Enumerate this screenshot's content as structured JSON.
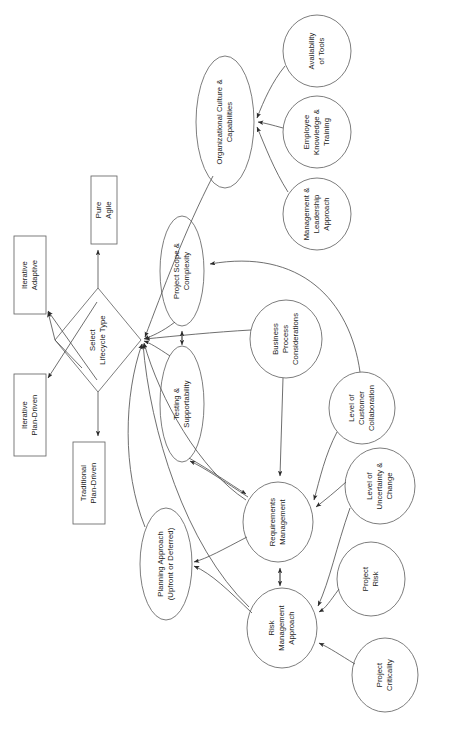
{
  "diagram": {
    "style": {
      "stroke": "#4d4d4d",
      "node_fill": "#ffffff",
      "text_color": "#1a1a1a",
      "background": "#ffffff",
      "text_orientation": "rotated-90-ccw"
    },
    "nodes": [
      {
        "id": "pure_agile",
        "label": "Pure\nAgile",
        "shape": "rectangle",
        "x": 91,
        "y": 176,
        "w": 26,
        "h": 68
      },
      {
        "id": "iter_adaptive",
        "label": "Iterative\nAdaptive",
        "shape": "rectangle",
        "x": 14,
        "y": 236,
        "w": 32,
        "h": 78
      },
      {
        "id": "iter_plan",
        "label": "Iterative\nPlan-Driven",
        "shape": "rectangle",
        "x": 14,
        "y": 374,
        "w": 32,
        "h": 82
      },
      {
        "id": "trad_plan",
        "label": "Traditional\nPlan-Driven",
        "shape": "rectangle",
        "x": 73,
        "y": 442,
        "w": 32,
        "h": 82
      },
      {
        "id": "select",
        "label": "Select\nLifecycle Type",
        "shape": "diamond",
        "x": 55,
        "y": 288,
        "w": 86,
        "h": 104
      },
      {
        "id": "org_culture",
        "label": "Organizational Culture &\nCapabilities",
        "shape": "ellipse",
        "x": 196,
        "y": 56,
        "w": 58,
        "h": 132
      },
      {
        "id": "avail_tools",
        "label": "Availability\nof Tools",
        "shape": "ellipse",
        "x": 283,
        "y": 15,
        "w": 68,
        "h": 72
      },
      {
        "id": "emp_knowledge",
        "label": "Employee\nKnowledge &\nTraining",
        "shape": "ellipse",
        "x": 283,
        "y": 96,
        "w": 68,
        "h": 72
      },
      {
        "id": "mgmt_leadership",
        "label": "Management &\nLeadership\nApproach",
        "shape": "ellipse",
        "x": 283,
        "y": 178,
        "w": 68,
        "h": 72
      },
      {
        "id": "proj_scope",
        "label": "Project Scope &\nComplexity",
        "shape": "ellipse",
        "x": 160,
        "y": 216,
        "w": 44,
        "h": 110
      },
      {
        "id": "testing",
        "label": "Testing &\nSupportability",
        "shape": "ellipse",
        "x": 160,
        "y": 346,
        "w": 44,
        "h": 116
      },
      {
        "id": "bus_process",
        "label": "Business\nProcess\nConsiderations",
        "shape": "ellipse",
        "x": 250,
        "y": 300,
        "w": 72,
        "h": 78
      },
      {
        "id": "cust_collab",
        "label": "Level of\nCustomer\nCollaboration",
        "shape": "ellipse",
        "x": 329,
        "y": 372,
        "w": 66,
        "h": 72
      },
      {
        "id": "uncertainty",
        "label": "Level of\nUncertainty &\nChange",
        "shape": "ellipse",
        "x": 345,
        "y": 448,
        "w": 70,
        "h": 76
      },
      {
        "id": "proj_risk",
        "label": "Project\nRisk",
        "shape": "ellipse",
        "x": 337,
        "y": 542,
        "w": 68,
        "h": 74
      },
      {
        "id": "proj_crit",
        "label": "Project\nCriticality",
        "shape": "ellipse",
        "x": 352,
        "y": 638,
        "w": 66,
        "h": 74
      },
      {
        "id": "req_mgmt",
        "label": "Requirements\nManagement",
        "shape": "ellipse",
        "x": 243,
        "y": 482,
        "w": 70,
        "h": 80
      },
      {
        "id": "risk_mgmt",
        "label": "Risk\nManagement\nApproach",
        "shape": "ellipse",
        "x": 247,
        "y": 588,
        "w": 70,
        "h": 80
      },
      {
        "id": "plan_approach",
        "label": "Planning Approach\n(Upfront or Deferred)",
        "shape": "ellipse",
        "x": 140,
        "y": 508,
        "w": 52,
        "h": 112
      }
    ],
    "edges": [
      {
        "from": "select",
        "to": "pure_agile",
        "type": "arrow"
      },
      {
        "from": "select",
        "to": "trad_plan",
        "type": "arrow"
      },
      {
        "from": "select",
        "to": "iter_adaptive",
        "type": "arrow"
      },
      {
        "from": "select",
        "to": "iter_plan",
        "type": "arrow"
      },
      {
        "from": "proj_scope",
        "to": "select",
        "type": "arrow"
      },
      {
        "from": "testing",
        "to": "select",
        "type": "arrow"
      },
      {
        "from": "org_culture",
        "to": "select",
        "type": "arrow"
      },
      {
        "from": "bus_process",
        "to": "select",
        "type": "arrow"
      },
      {
        "from": "req_mgmt",
        "to": "select",
        "type": "arrow"
      },
      {
        "from": "risk_mgmt",
        "to": "select",
        "type": "arrow"
      },
      {
        "from": "plan_approach",
        "to": "select",
        "type": "arrow"
      },
      {
        "from": "avail_tools",
        "to": "org_culture",
        "type": "arrow"
      },
      {
        "from": "emp_knowledge",
        "to": "org_culture",
        "type": "arrow"
      },
      {
        "from": "mgmt_leadership",
        "to": "org_culture",
        "type": "arrow"
      },
      {
        "from": "proj_scope",
        "to": "testing",
        "type": "double-arrow"
      },
      {
        "from": "req_mgmt",
        "to": "risk_mgmt",
        "type": "double-arrow"
      },
      {
        "from": "testing",
        "to": "req_mgmt",
        "type": "double-arrow-curved"
      },
      {
        "from": "bus_process",
        "to": "req_mgmt",
        "type": "arrow"
      },
      {
        "from": "cust_collab",
        "to": "req_mgmt",
        "type": "arrow"
      },
      {
        "from": "uncertainty",
        "to": "req_mgmt",
        "type": "arrow"
      },
      {
        "from": "uncertainty",
        "to": "risk_mgmt",
        "type": "arrow"
      },
      {
        "from": "proj_risk",
        "to": "risk_mgmt",
        "type": "arrow"
      },
      {
        "from": "proj_crit",
        "to": "risk_mgmt",
        "type": "arrow"
      },
      {
        "from": "cust_collab",
        "to": "proj_scope",
        "type": "arrow"
      },
      {
        "from": "req_mgmt",
        "to": "plan_approach",
        "type": "arrow"
      },
      {
        "from": "risk_mgmt",
        "to": "plan_approach",
        "type": "arrow"
      }
    ]
  }
}
